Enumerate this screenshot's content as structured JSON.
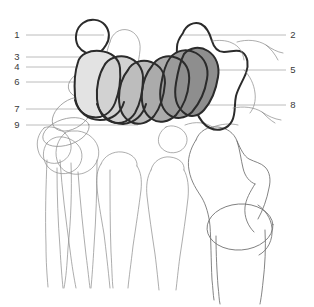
{
  "figure": {
    "background_color": "#ffffff",
    "width": 314,
    "height": 307
  },
  "labels": {
    "left": [
      {
        "id": "label-1",
        "text": "1",
        "x": 17,
        "y": 38,
        "line_x1": 26,
        "line_x2": 104,
        "line_y": 35
      },
      {
        "id": "label-3",
        "text": "3",
        "x": 17,
        "y": 60,
        "line_x1": 26,
        "line_x2": 122,
        "line_y": 57
      },
      {
        "id": "label-4",
        "text": "4",
        "x": 17,
        "y": 70,
        "line_x1": 26,
        "line_x2": 120,
        "line_y": 67
      },
      {
        "id": "label-6",
        "text": "6",
        "x": 17,
        "y": 85,
        "line_x1": 26,
        "line_x2": 122,
        "line_y": 82
      },
      {
        "id": "label-7",
        "text": "7",
        "x": 17,
        "y": 112,
        "line_x1": 26,
        "line_x2": 160,
        "line_y": 109
      },
      {
        "id": "label-9",
        "text": "9",
        "x": 17,
        "y": 128,
        "line_x1": 26,
        "line_x2": 138,
        "line_y": 125
      }
    ],
    "right": [
      {
        "id": "label-2",
        "text": "2",
        "x": 291,
        "y": 38,
        "line_x1": 182,
        "line_x2": 286,
        "line_y": 35
      },
      {
        "id": "label-5",
        "text": "5",
        "x": 291,
        "y": 73,
        "line_x1": 176,
        "line_x2": 286,
        "line_y": 70
      },
      {
        "id": "label-8",
        "text": "8",
        "x": 291,
        "y": 108,
        "line_x1": 176,
        "line_x2": 286,
        "line_y": 105
      }
    ]
  },
  "shaded_regions": [
    {
      "id": "region-a",
      "tone": "#e3e3e3",
      "description": "lightest shaded joint capsule, leftmost"
    },
    {
      "id": "region-b",
      "tone": "#d2d2d2",
      "description": "light-mid shaded joint capsule"
    },
    {
      "id": "region-c",
      "tone": "#bdbdbd",
      "description": "mid shaded joint capsule"
    },
    {
      "id": "region-d",
      "tone": "#ababab",
      "description": "mid-dark shaded joint capsule"
    },
    {
      "id": "region-e",
      "tone": "#9a9a9a",
      "description": "dark shaded joint capsule"
    },
    {
      "id": "region-f",
      "tone": "#8e8e8e",
      "description": "darkest shaded joint capsule, rightmost"
    }
  ],
  "colors": {
    "background": "#ffffff",
    "label_text": "#3a3a3a",
    "leader_line": "#b4b4b4",
    "thin_outline": "#8a8a8a",
    "heavy_outline": "#2b2b2b"
  }
}
